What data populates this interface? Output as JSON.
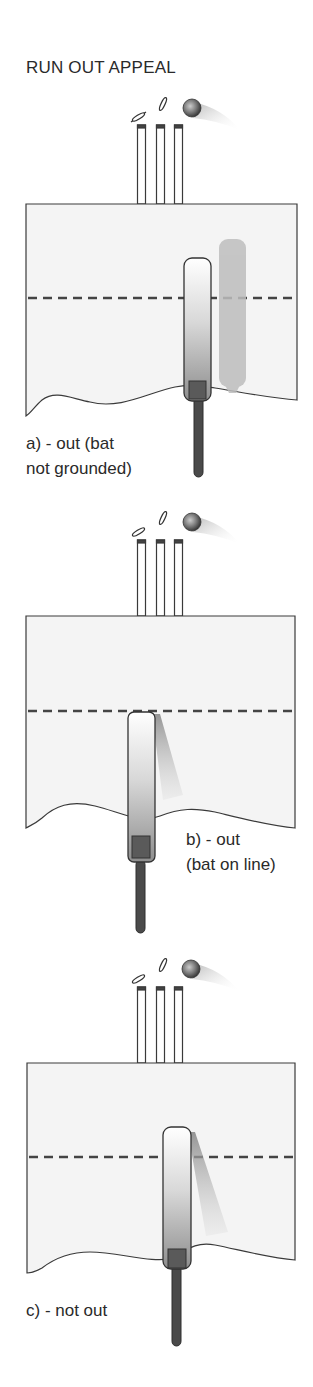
{
  "title": "RUN OUT APPEAL",
  "colors": {
    "outline": "#3a3a3a",
    "field_fill": "#f4f4f4",
    "crease": "#444444",
    "bat_dark": "#555555",
    "handle": "#4a4a4a",
    "ghost": "#bdbdbd"
  },
  "panels": [
    {
      "id": "a",
      "caption_line1": "a)  - out (bat",
      "caption_line2": "not grounded)",
      "bat_position": "behind crease, not grounded"
    },
    {
      "id": "b",
      "caption_line1": "b)  - out",
      "caption_line2": "(bat on line)",
      "bat_position": "on crease line"
    },
    {
      "id": "c",
      "caption_line1": "c) - not out",
      "caption_line2": "",
      "bat_position": "over crease, grounded"
    }
  ],
  "icons": [
    "stumps-icon",
    "bails-icon",
    "ball-icon",
    "bat-icon"
  ]
}
